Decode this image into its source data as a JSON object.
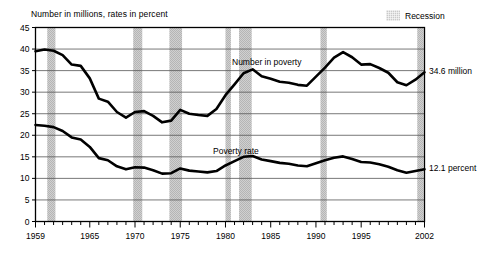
{
  "chart_data": {
    "type": "line",
    "title": "Number in millions, rates in percent",
    "xlabel": "",
    "ylabel": "",
    "ylim": [
      0,
      45
    ],
    "xlim": [
      1959,
      2002
    ],
    "grid": true,
    "y_ticks": [
      0,
      5,
      10,
      15,
      20,
      25,
      30,
      35,
      40,
      45
    ],
    "x_ticks": [
      1959,
      1965,
      1970,
      1975,
      1980,
      1985,
      1990,
      1995,
      2002
    ],
    "x_tick_labels": [
      "1959",
      "1965",
      "1970",
      "1975",
      "1980",
      "1985",
      "1990",
      "1995",
      "2002"
    ],
    "y_tick_labels": [
      "0",
      "5",
      "10",
      "15",
      "20",
      "25",
      "30",
      "35",
      "40",
      "45"
    ],
    "legend": {
      "position": "top-right",
      "entries": [
        {
          "label": "Recession",
          "swatch": "hatched-gray",
          "color": "#c9c9c9"
        }
      ]
    },
    "annotations": [
      {
        "text": "Number in poverty",
        "x": 1984,
        "y": 37.0,
        "type": "series-label"
      },
      {
        "text": "Poverty rate",
        "x": 1983,
        "y": 18.3,
        "type": "series-label"
      },
      {
        "text": "34.6 million",
        "x": 2002,
        "y": 34.6,
        "type": "end-value"
      },
      {
        "text": "12.1 percent",
        "x": 2002,
        "y": 12.1,
        "type": "end-value"
      }
    ],
    "recession_bands": [
      {
        "start": 1960.3,
        "end": 1961.2
      },
      {
        "start": 1969.8,
        "end": 1970.8
      },
      {
        "start": 1973.8,
        "end": 1975.2
      },
      {
        "start": 1980.0,
        "end": 1980.6
      },
      {
        "start": 1981.5,
        "end": 1982.9
      },
      {
        "start": 1990.5,
        "end": 1991.2
      },
      {
        "start": 2001.2,
        "end": 2001.9
      }
    ],
    "x": [
      1959,
      1960,
      1961,
      1962,
      1963,
      1964,
      1965,
      1966,
      1967,
      1968,
      1969,
      1970,
      1971,
      1972,
      1973,
      1974,
      1975,
      1976,
      1977,
      1978,
      1979,
      1980,
      1981,
      1982,
      1983,
      1984,
      1985,
      1986,
      1987,
      1988,
      1989,
      1990,
      1991,
      1992,
      1993,
      1994,
      1995,
      1996,
      1997,
      1998,
      1999,
      2000,
      2001,
      2002
    ],
    "series": [
      {
        "name": "Number in poverty",
        "units": "millions",
        "end_label": "34.6 million",
        "values": [
          39.5,
          39.9,
          39.6,
          38.6,
          36.4,
          36.1,
          33.2,
          28.5,
          27.8,
          25.4,
          24.1,
          25.4,
          25.6,
          24.5,
          23.0,
          23.4,
          25.9,
          25.0,
          24.7,
          24.5,
          26.1,
          29.3,
          31.8,
          34.4,
          35.3,
          33.7,
          33.1,
          32.4,
          32.2,
          31.7,
          31.5,
          33.6,
          35.7,
          38.0,
          39.3,
          38.1,
          36.4,
          36.5,
          35.6,
          34.5,
          32.3,
          31.6,
          32.9,
          34.6
        ]
      },
      {
        "name": "Poverty rate",
        "units": "percent",
        "end_label": "12.1 percent",
        "values": [
          22.4,
          22.2,
          21.9,
          21.0,
          19.5,
          19.0,
          17.3,
          14.7,
          14.2,
          12.8,
          12.1,
          12.6,
          12.5,
          11.9,
          11.1,
          11.2,
          12.3,
          11.8,
          11.6,
          11.4,
          11.7,
          13.0,
          14.0,
          15.0,
          15.2,
          14.4,
          14.0,
          13.6,
          13.4,
          13.0,
          12.8,
          13.5,
          14.2,
          14.8,
          15.1,
          14.5,
          13.8,
          13.7,
          13.3,
          12.7,
          11.9,
          11.3,
          11.7,
          12.1
        ]
      }
    ]
  },
  "labels": {
    "title": "Number in millions, rates in percent",
    "legend_recession": "Recession",
    "series_number": "Number in poverty",
    "series_rate": "Poverty rate",
    "end_number": "34.6 million",
    "end_rate": "12.1 percent"
  }
}
